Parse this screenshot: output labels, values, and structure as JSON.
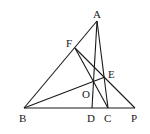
{
  "diagram": {
    "type": "geometry-triangle",
    "points": {
      "A": {
        "label": "A",
        "x": 97,
        "y": 21
      },
      "B": {
        "label": "B",
        "x": 24,
        "y": 108
      },
      "C": {
        "label": "C",
        "x": 108,
        "y": 108
      },
      "D": {
        "label": "D",
        "x": 92,
        "y": 108
      },
      "P": {
        "label": "P",
        "x": 135,
        "y": 108
      },
      "F": {
        "label": "F",
        "x": 75,
        "y": 48
      },
      "E": {
        "label": "E",
        "x": 105,
        "y": 77
      },
      "O": {
        "label": "O",
        "x": 94,
        "y": 81
      }
    },
    "segments": [
      "AB",
      "AC",
      "AD",
      "BP",
      "FC",
      "FP",
      "BE"
    ],
    "labels": {
      "A": "A",
      "B": "B",
      "C": "C",
      "D": "D",
      "P": "P",
      "F": "F",
      "E": "E",
      "O": "O"
    }
  }
}
